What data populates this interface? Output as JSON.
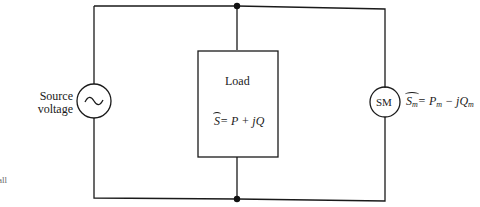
{
  "diagram": {
    "source": {
      "label_line1": "Source",
      "label_line2": "voltage",
      "symbol": "~"
    },
    "load": {
      "title": "Load",
      "S": "S",
      "eq": "= P + jQ"
    },
    "machine": {
      "label": "SM",
      "S": "S",
      "sub_m": "m",
      "eq_P": "= P",
      "eq_minus_jQ": " − jQ"
    },
    "margin_fragment": "all"
  }
}
